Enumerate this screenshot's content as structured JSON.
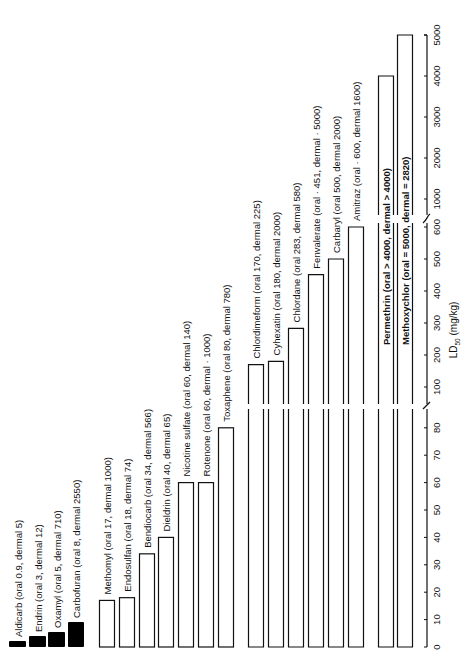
{
  "chart_data": {
    "type": "bar",
    "orientation": "vertical bars, figure rotated 90° (labels read bottom-to-top)",
    "title": "",
    "xlabel": "",
    "ylabel": "LD50 (mg/kg)",
    "ylabel_html": "LD",
    "ylabel_sub": "50",
    "ylabel_unit": " (mg/kg)",
    "axis_segments": [
      {
        "range": [
          0,
          80
        ],
        "ticks": [
          0,
          10,
          20,
          30,
          40,
          50,
          60,
          70,
          80
        ]
      },
      {
        "range": [
          100,
          600
        ],
        "ticks": [
          100,
          200,
          300,
          400,
          500,
          600
        ]
      },
      {
        "range": [
          1000,
          5000
        ],
        "ticks": [
          1000,
          2000,
          3000,
          4000,
          5000
        ]
      }
    ],
    "legend": "filled bars = highly toxic group; open bars = others",
    "groups": [
      {
        "name": "filled",
        "items": [
          {
            "label": "Aldicarb (oral   0.9, dermal   5)",
            "oral": 0.9,
            "dermal": 5
          },
          {
            "label": "Endrin (oral   3, dermal   12)",
            "oral": 3,
            "dermal": 12
          },
          {
            "label": "Oxamyl (oral   5, dermal   710)",
            "oral": 5,
            "dermal": 710
          },
          {
            "label": "Carbofuran (oral   8, dermal   2550)",
            "oral": 8,
            "dermal": 2550
          }
        ]
      },
      {
        "name": "open-low",
        "items": [
          {
            "label": "Methomyl (oral   17, dermal   1000)",
            "oral": 17,
            "dermal": 1000
          },
          {
            "label": "Endosulfan (oral   18, dermal   74)",
            "oral": 18,
            "dermal": 74
          },
          {
            "label": "Bendiocarb (oral   34, dermal   566)",
            "oral": 34,
            "dermal": 566
          },
          {
            "label": "Dieldrin (oral   40, dermal   65)",
            "oral": 40,
            "dermal": 65
          },
          {
            "label": "Nicotine sulfate (oral   60, dermal   140)",
            "oral": 60,
            "dermal": 140
          },
          {
            "label": "Rotenone (oral   60, dermal · 1000)",
            "oral": 60,
            "dermal": 1000
          },
          {
            "label": "Toxaphene (oral   80, dermal   780)",
            "oral": 80,
            "dermal": 780
          }
        ]
      },
      {
        "name": "open-mid",
        "items": [
          {
            "label": "Chlordimeform (oral   170, dermal   225)",
            "oral": 170,
            "dermal": 225
          },
          {
            "label": "Cyhexatin (oral   180, dermal   2000)",
            "oral": 180,
            "dermal": 2000
          },
          {
            "label": "Chlordane (oral   283, dermal   580)",
            "oral": 283,
            "dermal": 580
          },
          {
            "label": "Fenvalerate (oral · 451, dermal · 5000)",
            "oral": 451,
            "dermal": 5000
          },
          {
            "label": "Carbaryl (oral   500, dermal   2000)",
            "oral": 500,
            "dermal": 2000
          },
          {
            "label": "Amitraz (oral · 600, dermal   1600)",
            "oral": 600,
            "dermal": 1600
          }
        ]
      },
      {
        "name": "open-high",
        "items": [
          {
            "label": "Permethrin (oral > 4000, dermal > 4000)",
            "oral": 4000,
            "dermal": 4000
          },
          {
            "label": "Methoxychlor (oral = 5000, dermal = 2820)",
            "oral": 5000,
            "dermal": 2820
          }
        ]
      }
    ],
    "categories": [
      "Aldicarb",
      "Endrin",
      "Oxamyl",
      "Carbofuran",
      "Methomyl",
      "Endosulfan",
      "Bendiocarb",
      "Dieldrin",
      "Nicotine sulfate",
      "Rotenone",
      "Toxaphene",
      "Chlordimeform",
      "Cyhexatin",
      "Chlordane",
      "Fenvalerate",
      "Carbaryl",
      "Amitraz",
      "Permethrin",
      "Methoxychlor"
    ],
    "series": [
      {
        "name": "Oral LD50 (mg/kg)",
        "values": [
          0.9,
          3,
          5,
          8,
          17,
          18,
          34,
          40,
          60,
          60,
          80,
          170,
          180,
          283,
          451,
          500,
          600,
          4000,
          5000
        ]
      },
      {
        "name": "Dermal LD50 (mg/kg)",
        "values": [
          5,
          12,
          710,
          2550,
          1000,
          74,
          566,
          65,
          140,
          1000,
          780,
          225,
          2000,
          580,
          5000,
          2000,
          1600,
          4000,
          2820
        ]
      }
    ]
  }
}
